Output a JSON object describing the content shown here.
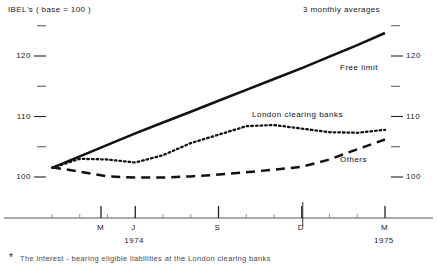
{
  "header": {
    "title": "IBEL's ( base = 100 )",
    "subtitle": "3 monthly averages"
  },
  "footnote": {
    "marker": "*",
    "text": "The interest - bearing eligible liabilities  at the  London  clearing banks"
  },
  "chart_data": {
    "type": "line",
    "title": "IBEL's ( base = 100 )",
    "subtitle": "3 monthly averages",
    "xlabel": "",
    "ylabel": "IBEL's ( base = 100 )",
    "ylim": [
      96,
      126
    ],
    "yticks_major": [
      100,
      110,
      120
    ],
    "yticks_minor": [
      105,
      115,
      125
    ],
    "ytick_labels_left": [
      "120",
      "110",
      "100"
    ],
    "ytick_labels_right": [
      "120",
      "110",
      "100"
    ],
    "grid": false,
    "legend_position": "inline-annotations",
    "x_major_labels": [
      "M",
      "J",
      "S",
      "D",
      "M"
    ],
    "x_year_labels": [
      {
        "label": "1974",
        "at": "J"
      },
      {
        "label": "1975",
        "at": "M"
      }
    ],
    "x": [
      "M-74",
      "A",
      "M",
      "J-74",
      "J",
      "A",
      "S-74",
      "O",
      "N",
      "D-74",
      "J",
      "F",
      "M-75"
    ],
    "series": [
      {
        "name": "Free limit",
        "style": "solid",
        "color": "#111111",
        "values": [
          101.5,
          103.4,
          105.3,
          107.2,
          109.0,
          110.8,
          112.6,
          114.4,
          116.2,
          118.0,
          119.9,
          121.8,
          123.8
        ]
      },
      {
        "name": "London clearing banks",
        "style": "dotted",
        "color": "#111111",
        "values": [
          101.5,
          103.0,
          102.9,
          102.4,
          103.6,
          105.6,
          107.0,
          108.4,
          108.6,
          108.0,
          107.4,
          107.3,
          107.8
        ]
      },
      {
        "name": "Others",
        "style": "dashed",
        "color": "#111111",
        "values": [
          101.6,
          100.9,
          100.1,
          99.9,
          99.9,
          100.1,
          100.4,
          100.8,
          101.2,
          101.7,
          102.9,
          104.6,
          106.2
        ]
      }
    ],
    "annotations": [
      {
        "text": "Free limit",
        "x": 340,
        "y": 63
      },
      {
        "text": "London clearing banks",
        "x": 252,
        "y": 110
      },
      {
        "text": "Others",
        "x": 340,
        "y": 155
      }
    ]
  }
}
